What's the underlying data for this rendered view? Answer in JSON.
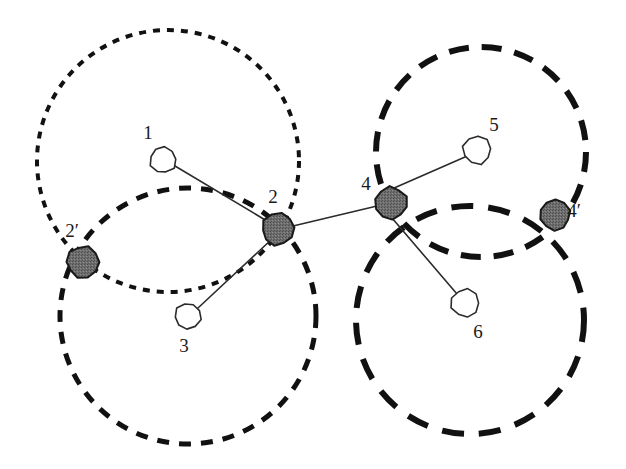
{
  "figure": {
    "background_color": "#ffffff",
    "width": 626,
    "height": 469
  },
  "style": {
    "filled_node_fill": "#6a6a6a",
    "filled_node_stroke": "#1a1a1a",
    "open_node_fill": "#ffffff",
    "open_node_stroke": "#2b2b2b",
    "edge_color": "#2b2b2b",
    "circle_color": "#111111",
    "label_color": "#1a1a1a"
  },
  "nodes": [
    {
      "id": "1",
      "label": "1",
      "type": "open",
      "cx": 163,
      "cy": 160,
      "r": 13,
      "label_x": 148,
      "label_y": 139
    },
    {
      "id": "2",
      "label": "2",
      "type": "filled",
      "cx": 278,
      "cy": 229,
      "r": 16,
      "label_x": 273,
      "label_y": 203
    },
    {
      "id": "2p",
      "label": "2′",
      "type": "filled",
      "cx": 83,
      "cy": 262,
      "r": 16,
      "label_x": 72,
      "label_y": 237
    },
    {
      "id": "3",
      "label": "3",
      "type": "open",
      "cx": 188,
      "cy": 316,
      "r": 13,
      "label_x": 184,
      "label_y": 352
    },
    {
      "id": "4",
      "label": "4",
      "type": "filled",
      "cx": 391,
      "cy": 203,
      "r": 16,
      "label_x": 366,
      "label_y": 190
    },
    {
      "id": "4p",
      "label": "4′",
      "type": "filled",
      "cx": 555,
      "cy": 215,
      "r": 15,
      "label_x": 574,
      "label_y": 217
    },
    {
      "id": "5",
      "label": "5",
      "type": "open",
      "cx": 477,
      "cy": 150,
      "r": 14,
      "label_x": 494,
      "label_y": 131
    },
    {
      "id": "6",
      "label": "6",
      "type": "open",
      "cx": 465,
      "cy": 303,
      "r": 14,
      "label_x": 478,
      "label_y": 338
    }
  ],
  "edges": [
    {
      "id": "e-1-2",
      "from": "1",
      "to": "2",
      "x1": 175,
      "y1": 166,
      "x2": 272,
      "y2": 224
    },
    {
      "id": "e-3-2",
      "from": "3",
      "to": "2",
      "x1": 198,
      "y1": 308,
      "x2": 272,
      "y2": 239
    },
    {
      "id": "e-2-4",
      "from": "2",
      "to": "4",
      "x1": 293,
      "y1": 226,
      "x2": 377,
      "y2": 206
    },
    {
      "id": "e-5-4",
      "from": "5",
      "to": "4",
      "x1": 465,
      "y1": 157,
      "x2": 385,
      "y2": 192
    },
    {
      "id": "e-6-4",
      "from": "6",
      "to": "4",
      "x1": 457,
      "y1": 294,
      "x2": 392,
      "y2": 218
    }
  ],
  "circles": [
    {
      "id": "circle-top-left",
      "owner": "1",
      "cx": 168,
      "cy": 161,
      "r": 131,
      "dash": "7 7",
      "width": 4
    },
    {
      "id": "circle-bottom-left",
      "owner": "3",
      "cx": 188,
      "cy": 316,
      "r": 128,
      "dash": "12 10",
      "width": 5
    },
    {
      "id": "circle-top-right",
      "owner": "5",
      "cx": 481,
      "cy": 152,
      "r": 105,
      "dash": "20 13",
      "width": 6
    },
    {
      "id": "circle-bottom-right",
      "owner": "6",
      "cx": 470,
      "cy": 320,
      "r": 114,
      "dash": "22 15",
      "width": 6
    }
  ]
}
